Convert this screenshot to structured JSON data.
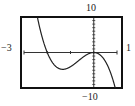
{
  "chart_data": {
    "type": "line",
    "title": "",
    "xlabel": "",
    "ylabel": "",
    "xlim": [
      -3,
      1
    ],
    "ylim": [
      -10,
      10
    ],
    "grid": false,
    "legend": null,
    "window_labels": {
      "xmin": "−3",
      "xmax": "1",
      "ymin": "−10",
      "ymax": "10"
    },
    "x_ticks": [
      -2,
      -1,
      0
    ],
    "y_ticks": [
      -9,
      -8,
      -7,
      -6,
      -5,
      -4,
      -3,
      -2,
      -1,
      1,
      2,
      3,
      4,
      5,
      6,
      7,
      8,
      9
    ],
    "series": [
      {
        "name": "f(x)",
        "expression": "-4x^3 - 8x^2",
        "x": [
          -2.4,
          -2.2,
          -2.0,
          -1.8,
          -1.6,
          -1.4,
          -1.333,
          -1.2,
          -1.0,
          -0.8,
          -0.6,
          -0.4,
          -0.2,
          0.0,
          0.2,
          0.4,
          0.6,
          0.8,
          0.9
        ],
        "y": [
          9.22,
          3.87,
          0.0,
          -2.59,
          -4.1,
          -4.7,
          -4.74,
          -4.61,
          -4.0,
          -3.07,
          -2.02,
          -1.02,
          -0.29,
          0.0,
          -0.35,
          -1.54,
          -3.74,
          -7.17,
          -9.4
        ]
      }
    ],
    "key_points": [
      {
        "label": "x-intercept",
        "x": -2,
        "y": 0
      },
      {
        "label": "local min",
        "x": -1.33,
        "y": -4.74
      },
      {
        "label": "local max / double root",
        "x": 0,
        "y": 0
      }
    ]
  }
}
